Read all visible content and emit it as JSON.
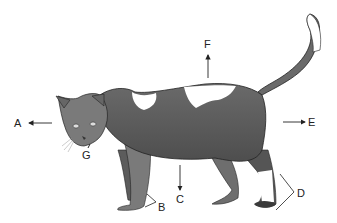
{
  "figure": {
    "colors": {
      "fur_dark": "#5a5a5a",
      "fur_mid": "#7a7a7a",
      "fur_white": "#ffffff",
      "outline": "#222222",
      "arrow": "#222222"
    }
  },
  "labels": [
    {
      "id": "A",
      "text": "A",
      "arrow": "left",
      "x": 14,
      "y": 118
    },
    {
      "id": "B",
      "text": "B",
      "arrow": "bracket",
      "x": 158,
      "y": 202
    },
    {
      "id": "C",
      "text": "C",
      "arrow": "down",
      "x": 175,
      "y": 195
    },
    {
      "id": "D",
      "text": "D",
      "arrow": "bracket",
      "x": 297,
      "y": 188
    },
    {
      "id": "E",
      "text": "E",
      "arrow": "right",
      "x": 308,
      "y": 118
    },
    {
      "id": "F",
      "text": "F",
      "arrow": "up",
      "x": 204,
      "y": 39
    },
    {
      "id": "G",
      "text": "G",
      "arrow": "pointer",
      "x": 82,
      "y": 150
    }
  ]
}
